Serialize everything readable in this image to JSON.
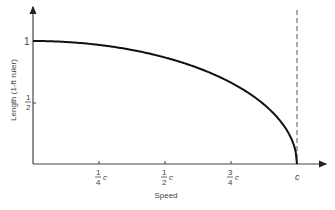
{
  "chart_data": {
    "type": "line",
    "title": "",
    "xlabel": "Speed",
    "ylabel": "Length (1-ft ruler)",
    "x_ticks": [
      {
        "num": "1",
        "den": "4",
        "suffix": "c",
        "value": 0.25
      },
      {
        "num": "1",
        "den": "2",
        "suffix": "c",
        "value": 0.5
      },
      {
        "num": "3",
        "den": "4",
        "suffix": "c",
        "value": 0.75
      },
      {
        "num": "",
        "den": "",
        "suffix": "c",
        "value": 1.0
      }
    ],
    "y_ticks": [
      {
        "label": "1",
        "value": 1.0
      },
      {
        "label": "1/2",
        "num": "1",
        "den": "2",
        "value": 0.5
      }
    ],
    "series": [
      {
        "name": "Length contraction",
        "x": [
          0,
          0.1,
          0.2,
          0.3,
          0.4,
          0.5,
          0.6,
          0.7,
          0.8,
          0.9,
          0.95,
          0.99,
          1.0
        ],
        "values": [
          1.0,
          0.995,
          0.98,
          0.954,
          0.917,
          0.866,
          0.8,
          0.714,
          0.6,
          0.436,
          0.312,
          0.141,
          0.0
        ]
      }
    ],
    "asymptote": {
      "x": 1.0,
      "style": "dashed",
      "label": "c"
    },
    "xlim": [
      0,
      1.1
    ],
    "ylim": [
      0,
      1.3
    ],
    "grid": false,
    "legend": null
  }
}
